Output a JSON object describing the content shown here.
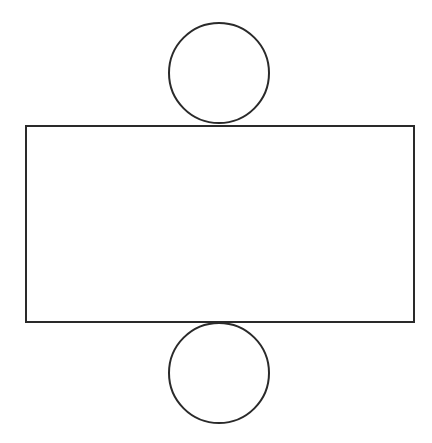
{
  "diagram": {
    "stroke_color": "#2a2a2a",
    "background": "#ffffff",
    "shapes": {
      "top_circle": {
        "cx": 219,
        "cy": 73,
        "r": 50
      },
      "rectangle": {
        "x": 26,
        "y": 126,
        "width": 388,
        "height": 196
      },
      "bottom_circle": {
        "cx": 219,
        "cy": 373,
        "r": 50
      }
    }
  }
}
